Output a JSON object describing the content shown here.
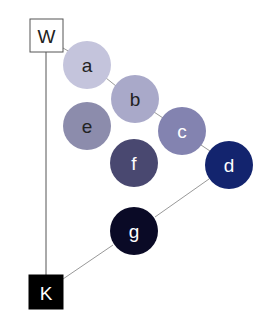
{
  "diagram": {
    "squares": [
      {
        "id": "W",
        "label": "W",
        "x": 30,
        "y": 19,
        "size": 33,
        "fill": "#ffffff",
        "stroke": "#555555",
        "text_color": "#222222"
      },
      {
        "id": "K",
        "label": "K",
        "x": 29,
        "y": 275,
        "size": 34,
        "fill": "#000000",
        "stroke": "#000000",
        "text_color": "#ffffff"
      }
    ],
    "circles": [
      {
        "id": "a",
        "label": "a",
        "cx": 87,
        "cy": 65,
        "r": 24,
        "fill": "#c4c4dc",
        "text_color": "#222222"
      },
      {
        "id": "b",
        "label": "b",
        "cx": 135,
        "cy": 99,
        "r": 24,
        "fill": "#a9a9c9",
        "text_color": "#222222"
      },
      {
        "id": "c",
        "label": "c",
        "cx": 182,
        "cy": 131,
        "r": 24,
        "fill": "#8383b0",
        "text_color": "#ffffff"
      },
      {
        "id": "d",
        "label": "d",
        "cx": 229,
        "cy": 165,
        "r": 24,
        "fill": "#13246e",
        "text_color": "#ffffff"
      },
      {
        "id": "e",
        "label": "e",
        "cx": 87,
        "cy": 126,
        "r": 24,
        "fill": "#8c8cac",
        "text_color": "#222222"
      },
      {
        "id": "f",
        "label": "f",
        "cx": 134,
        "cy": 163,
        "r": 24,
        "fill": "#494870",
        "text_color": "#ffffff"
      },
      {
        "id": "g",
        "label": "g",
        "cx": 134,
        "cy": 231,
        "r": 24,
        "fill": "#0a0a26",
        "text_color": "#ffffff"
      }
    ],
    "edges": [
      {
        "from": "W",
        "to": "K",
        "x1": 46,
        "y1": 52,
        "x2": 46,
        "y2": 275,
        "color": "#555555"
      },
      {
        "from": "W",
        "to": "a",
        "x1": 63,
        "y1": 48,
        "x2": 70,
        "y2": 52,
        "color": "#999999"
      },
      {
        "from": "a",
        "to": "b",
        "x1": 106,
        "y1": 78,
        "x2": 116,
        "y2": 86,
        "color": "#999999"
      },
      {
        "from": "b",
        "to": "c",
        "x1": 154,
        "y1": 112,
        "x2": 163,
        "y2": 118,
        "color": "#999999"
      },
      {
        "from": "c",
        "to": "d",
        "x1": 201,
        "y1": 145,
        "x2": 210,
        "y2": 151,
        "color": "#999999"
      },
      {
        "from": "d",
        "to": "g",
        "x1": 209,
        "y1": 179,
        "x2": 155,
        "y2": 217,
        "color": "#999999"
      },
      {
        "from": "g",
        "to": "K",
        "x1": 113,
        "y1": 245,
        "x2": 63,
        "y2": 279,
        "color": "#999999"
      }
    ]
  }
}
